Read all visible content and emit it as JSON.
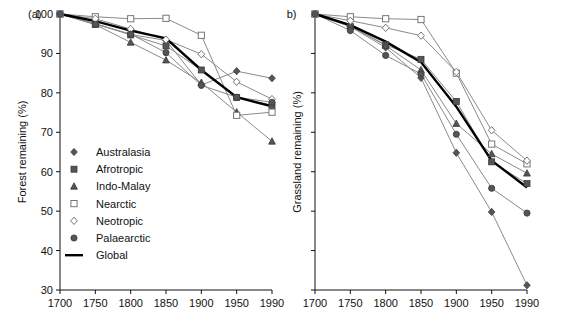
{
  "figure": {
    "panel_a_tag": "(a)",
    "panel_b_tag": "(b)",
    "panel_a_ylabel": "Forest remaining (%)",
    "panel_b_ylabel": "Grassland remaining (%)"
  },
  "legend": {
    "position": "inside-lower-left-panel-a",
    "items": [
      {
        "label": "Australasia",
        "marker": "filled-diamond",
        "color": "#555555"
      },
      {
        "label": "Afrotropic",
        "marker": "filled-square",
        "color": "#555555"
      },
      {
        "label": "Indo-Malay",
        "marker": "filled-triangle",
        "color": "#555555"
      },
      {
        "label": "Nearctic",
        "marker": "open-square",
        "color": "#ffffff"
      },
      {
        "label": "Neotropic",
        "marker": "open-diamond",
        "color": "#ffffff"
      },
      {
        "label": "Palaearctic",
        "marker": "filled-circle",
        "color": "#555555"
      },
      {
        "label": "Global",
        "marker": "thick-line",
        "color": "#000000"
      }
    ]
  },
  "chart_data": [
    {
      "id": "panel-a",
      "type": "line",
      "title": "(a)",
      "xlabel": "",
      "ylabel": "Forest remaining (%)",
      "x": [
        1700,
        1750,
        1800,
        1850,
        1900,
        1950,
        1990
      ],
      "xticklabels": [
        "1700",
        "1750",
        "1800",
        "1850",
        "1900",
        "1950",
        "1990"
      ],
      "xlim": [
        1700,
        1990
      ],
      "ylim": [
        30,
        100
      ],
      "yticks": [
        30,
        40,
        50,
        60,
        70,
        80,
        90,
        100
      ],
      "yticklabels": [
        "30",
        "40",
        "50",
        "60",
        "70",
        "80",
        "90",
        "100"
      ],
      "grid": false,
      "series": [
        {
          "name": "Australasia",
          "marker": "filled-diamond",
          "values": [
            100.0,
            97.5,
            94.8,
            93.3,
            82.0,
            85.5,
            83.7
          ]
        },
        {
          "name": "Afrotropic",
          "marker": "filled-square",
          "values": [
            100.0,
            97.6,
            94.7,
            91.9,
            85.8,
            78.8,
            76.8
          ]
        },
        {
          "name": "Indo-Malay",
          "marker": "filled-triangle",
          "values": [
            100.0,
            97.3,
            92.8,
            88.3,
            82.6,
            75.1,
            67.7
          ]
        },
        {
          "name": "Nearctic",
          "marker": "open-square",
          "values": [
            100.0,
            99.3,
            98.8,
            98.9,
            94.6,
            74.3,
            75.1
          ]
        },
        {
          "name": "Neotropic",
          "marker": "open-diamond",
          "values": [
            100.0,
            98.8,
            96.2,
            93.5,
            89.8,
            82.8,
            78.4
          ]
        },
        {
          "name": "Palaearctic",
          "marker": "filled-circle",
          "values": [
            100.0,
            97.4,
            94.9,
            90.2,
            81.9,
            78.9,
            77.6
          ]
        },
        {
          "name": "Global",
          "marker": "thick-line",
          "values": [
            100.0,
            98.2,
            95.8,
            93.8,
            85.8,
            78.9,
            76.6
          ]
        }
      ]
    },
    {
      "id": "panel-b",
      "type": "line",
      "title": "(b)",
      "xlabel": "",
      "ylabel": "Grassland remaining (%)",
      "x": [
        1700,
        1750,
        1800,
        1850,
        1900,
        1950,
        1990
      ],
      "xticklabels": [
        "1700",
        "1750",
        "1800",
        "1850",
        "1900",
        "1950",
        "1990"
      ],
      "xlim": [
        1700,
        1990
      ],
      "ylim": [
        30,
        100
      ],
      "yticks": [
        30,
        40,
        50,
        60,
        70,
        80,
        90,
        100
      ],
      "yticklabels": [
        "",
        "",
        "",
        "",
        "",
        "",
        "",
        ""
      ],
      "grid": false,
      "note": "y-axis ticks present but unlabelled; same 30-100 scale as panel (a)",
      "series": [
        {
          "name": "Australasia",
          "marker": "filled-diamond",
          "values": [
            100.0,
            96.8,
            91.5,
            83.8,
            64.8,
            49.8,
            31.2
          ]
        },
        {
          "name": "Afrotropic",
          "marker": "filled-square",
          "values": [
            100.0,
            96.8,
            92.2,
            88.5,
            77.8,
            62.5,
            57.0
          ]
        },
        {
          "name": "Indo-Malay",
          "marker": "filled-triangle",
          "values": [
            100.0,
            97.0,
            92.0,
            85.8,
            72.2,
            64.5,
            59.6
          ]
        },
        {
          "name": "Nearctic",
          "marker": "open-square",
          "values": [
            100.0,
            99.3,
            98.8,
            98.6,
            85.0,
            67.0,
            62.0
          ]
        },
        {
          "name": "Neotropic",
          "marker": "open-diamond",
          "values": [
            100.0,
            98.3,
            96.5,
            94.5,
            85.3,
            70.5,
            62.8
          ]
        },
        {
          "name": "Palaearctic",
          "marker": "filled-circle",
          "values": [
            100.0,
            95.8,
            89.5,
            84.8,
            69.5,
            55.8,
            49.5
          ]
        },
        {
          "name": "Global",
          "marker": "thick-line",
          "values": [
            100.0,
            97.2,
            93.0,
            87.8,
            76.5,
            62.8,
            56.0
          ]
        }
      ]
    }
  ]
}
